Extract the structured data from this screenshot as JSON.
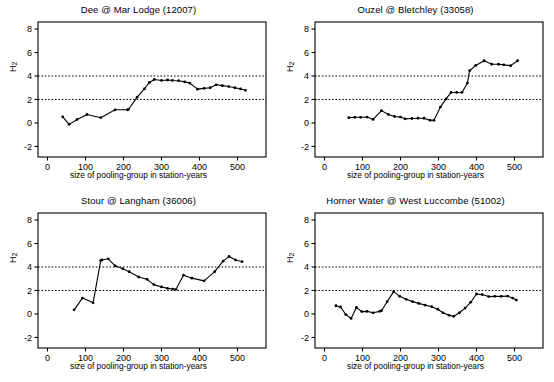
{
  "figure": {
    "background": "#ffffff",
    "line_color": "#000000",
    "marker_color": "#000000",
    "threshold_color": "#000000",
    "axis_color": "#000000",
    "panel_count": 4
  },
  "common": {
    "xlabel": "size of pooling-group in station-years",
    "ylabel_main": "H",
    "ylabel_sub": "2",
    "xticks": [
      0,
      100,
      200,
      300,
      400,
      500
    ],
    "yticks": [
      -2,
      0,
      2,
      4,
      6,
      8
    ],
    "xlim": [
      -25,
      575
    ],
    "ylim": [
      -2.9,
      8.6
    ],
    "thresholds": [
      2,
      4
    ]
  },
  "chart_data": [
    {
      "type": "line",
      "title": "Dee @ Mar Lodge (12007)",
      "xlabel": "size of pooling-group in station-years",
      "ylabel": "H2",
      "xlim": [
        -25,
        575
      ],
      "ylim": [
        -2.9,
        8.6
      ],
      "xticks": [
        0,
        100,
        200,
        300,
        400,
        500
      ],
      "yticks": [
        -2,
        0,
        2,
        4,
        6,
        8
      ],
      "grid": false,
      "hlines": [
        2,
        4
      ],
      "x": [
        40,
        57,
        78,
        104,
        140,
        178,
        211,
        213,
        236,
        255,
        268,
        281,
        300,
        316,
        329,
        345,
        361,
        374,
        395,
        412,
        428,
        444,
        460,
        477,
        493,
        508,
        521
      ],
      "y": [
        0.52,
        -0.12,
        0.3,
        0.72,
        0.45,
        1.12,
        1.12,
        1.15,
        2.2,
        2.9,
        3.45,
        3.7,
        3.62,
        3.66,
        3.62,
        3.6,
        3.5,
        3.4,
        2.88,
        2.95,
        3.0,
        3.25,
        3.18,
        3.1,
        3.0,
        2.9,
        2.78
      ]
    },
    {
      "type": "line",
      "title": "Ouzel @ Bletchley (33058)",
      "xlabel": "size of pooling-group in station-years",
      "ylabel": "H2",
      "xlim": [
        -25,
        575
      ],
      "ylim": [
        -2.9,
        8.6
      ],
      "xticks": [
        0,
        100,
        200,
        300,
        400,
        500
      ],
      "yticks": [
        -2,
        0,
        2,
        4,
        6,
        8
      ],
      "grid": false,
      "hlines": [
        2,
        4
      ],
      "x": [
        64,
        80,
        95,
        112,
        128,
        150,
        168,
        184,
        200,
        212,
        230,
        246,
        262,
        278,
        288,
        305,
        320,
        333,
        348,
        362,
        376,
        382,
        398,
        420,
        440,
        458,
        472,
        490,
        508
      ],
      "y": [
        0.45,
        0.48,
        0.48,
        0.5,
        0.3,
        1.05,
        0.72,
        0.55,
        0.5,
        0.35,
        0.38,
        0.4,
        0.4,
        0.22,
        0.22,
        1.35,
        2.05,
        2.6,
        2.6,
        2.6,
        3.4,
        4.45,
        4.9,
        5.3,
        5.0,
        5.0,
        4.95,
        4.88,
        5.3
      ]
    },
    {
      "type": "line",
      "title": "Stour @ Langham (36006)",
      "xlabel": "size of pooling-group in station-years",
      "ylabel": "H2",
      "xlim": [
        -25,
        575
      ],
      "ylim": [
        -2.9,
        8.6
      ],
      "xticks": [
        0,
        100,
        200,
        300,
        400,
        500
      ],
      "yticks": [
        -2,
        0,
        2,
        4,
        6,
        8
      ],
      "grid": false,
      "hlines": [
        2,
        4
      ],
      "x": [
        70,
        92,
        120,
        140,
        143,
        160,
        178,
        198,
        215,
        240,
        262,
        280,
        300,
        316,
        330,
        338,
        358,
        380,
        412,
        440,
        462,
        478,
        495,
        512
      ],
      "y": [
        0.35,
        1.35,
        0.95,
        4.55,
        4.6,
        4.7,
        4.1,
        3.85,
        3.6,
        3.15,
        2.95,
        2.5,
        2.3,
        2.18,
        2.12,
        2.1,
        3.3,
        3.05,
        2.82,
        3.6,
        4.5,
        4.9,
        4.6,
        4.45
      ]
    },
    {
      "type": "line",
      "title": "Horner Water @ West Luccombe (51002)",
      "xlabel": "size of pooling-group in station-years",
      "ylabel": "H2",
      "xlim": [
        -25,
        575
      ],
      "ylim": [
        -2.9,
        8.6
      ],
      "xticks": [
        0,
        100,
        200,
        300,
        400,
        500
      ],
      "yticks": [
        -2,
        0,
        2,
        4,
        6,
        8
      ],
      "grid": false,
      "hlines": [
        2,
        4
      ],
      "x": [
        30,
        42,
        56,
        70,
        84,
        98,
        112,
        128,
        145,
        150,
        165,
        182,
        198,
        215,
        232,
        248,
        265,
        282,
        298,
        312,
        328,
        340,
        355,
        370,
        385,
        400,
        415,
        432,
        448,
        465,
        482,
        495,
        505
      ],
      "y": [
        0.7,
        0.6,
        -0.05,
        -0.38,
        0.55,
        0.2,
        0.22,
        0.1,
        0.22,
        0.28,
        1.05,
        1.9,
        1.5,
        1.25,
        1.05,
        0.9,
        0.75,
        0.62,
        0.4,
        0.1,
        -0.12,
        -0.2,
        0.1,
        0.5,
        1.0,
        1.7,
        1.65,
        1.48,
        1.5,
        1.5,
        1.52,
        1.35,
        1.18
      ]
    }
  ]
}
